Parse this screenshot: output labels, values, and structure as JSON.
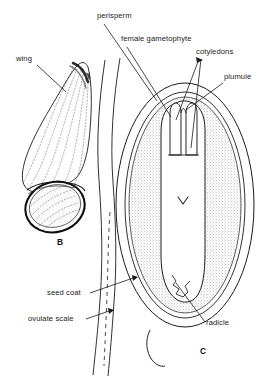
{
  "figure": {
    "type": "botanical-line-drawing",
    "background_color": "#ffffff",
    "ink_color": "#1a1a1a",
    "stipple_color": "#6e6e6e"
  },
  "panels": [
    {
      "id": "B",
      "letter": "B",
      "caption": "winged seed, external view",
      "x": 57,
      "y": 243
    },
    {
      "id": "C",
      "letter": "C",
      "caption": "seed longitudinal section",
      "x": 200,
      "y": 352
    }
  ],
  "labels": [
    {
      "id": "wing",
      "text": "wing",
      "x": 16,
      "y": 61,
      "anchor": "start"
    },
    {
      "id": "perisperm",
      "text": "perisperm",
      "x": 97,
      "y": 18,
      "anchor": "start"
    },
    {
      "id": "female_gametophyte",
      "text": "female gametophyte",
      "x": 121,
      "y": 41,
      "anchor": "start"
    },
    {
      "id": "cotyledons",
      "text": "cotyledons",
      "x": 196,
      "y": 54,
      "anchor": "start"
    },
    {
      "id": "plumule",
      "text": "plumule",
      "x": 224,
      "y": 79,
      "anchor": "start"
    },
    {
      "id": "seed_coat",
      "text": "seed coat",
      "x": 47,
      "y": 295,
      "anchor": "start"
    },
    {
      "id": "ovulate_scale",
      "text": "ovulate scale",
      "x": 28,
      "y": 321,
      "anchor": "start"
    },
    {
      "id": "radicle",
      "text": "radicle",
      "x": 206,
      "y": 325,
      "anchor": "start"
    }
  ]
}
